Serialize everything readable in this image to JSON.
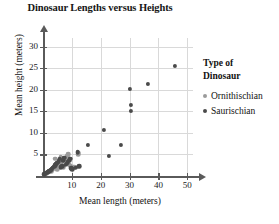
{
  "chart_data": {
    "type": "scatter",
    "title": "Dinosaur Lengths versus Heights",
    "xlabel": "Mean length (meters)",
    "ylabel": "Mean height (meters)",
    "xlim": [
      0,
      52
    ],
    "ylim": [
      0,
      32
    ],
    "xticks": [
      10,
      20,
      30,
      40,
      50
    ],
    "yticks": [
      5,
      10,
      15,
      20,
      25,
      30
    ],
    "grid": true,
    "legend_position": "right",
    "legend_title_line1": "Type of",
    "legend_title_line2": "Dinosaur",
    "series": [
      {
        "name": "Ornithischian",
        "color": "#9b9b9b",
        "points": [
          [
            0.8,
            0.5
          ],
          [
            1.2,
            0.7
          ],
          [
            1.6,
            0.9
          ],
          [
            2.0,
            1.0
          ],
          [
            2.4,
            1.2
          ],
          [
            2.8,
            1.4
          ],
          [
            3.2,
            1.5
          ],
          [
            3.6,
            1.8
          ],
          [
            4.0,
            2.0
          ],
          [
            4.4,
            2.1
          ],
          [
            4.8,
            2.3
          ],
          [
            5.2,
            2.5
          ],
          [
            5.6,
            2.7
          ],
          [
            6.0,
            3.0
          ],
          [
            6.4,
            3.2
          ],
          [
            6.8,
            3.4
          ],
          [
            7.2,
            3.6
          ],
          [
            7.6,
            3.9
          ],
          [
            8.0,
            4.1
          ],
          [
            8.4,
            4.6
          ],
          [
            8.8,
            5.0
          ],
          [
            9.0,
            2.6
          ],
          [
            9.4,
            2.4
          ],
          [
            9.8,
            2.2
          ],
          [
            10.4,
            2.1
          ],
          [
            11.0,
            2.0
          ],
          [
            12.0,
            2.1
          ],
          [
            12.2,
            5.1
          ],
          [
            12.4,
            5.4
          ],
          [
            7.0,
            2.0
          ],
          [
            5.0,
            1.6
          ],
          [
            3.0,
            1.0
          ],
          [
            4.2,
            4.0
          ],
          [
            6.2,
            4.4
          ],
          [
            8.2,
            3.0
          ]
        ]
      },
      {
        "name": "Saurischian",
        "color": "#4a4a4a",
        "points": [
          [
            0.5,
            0.4
          ],
          [
            1.0,
            0.6
          ],
          [
            1.4,
            0.8
          ],
          [
            1.8,
            1.0
          ],
          [
            2.2,
            1.1
          ],
          [
            2.6,
            1.3
          ],
          [
            3.0,
            1.6
          ],
          [
            3.4,
            1.9
          ],
          [
            3.8,
            2.2
          ],
          [
            4.2,
            2.5
          ],
          [
            4.6,
            2.8
          ],
          [
            5.0,
            3.1
          ],
          [
            5.4,
            3.4
          ],
          [
            5.8,
            4.0
          ],
          [
            6.2,
            2.0
          ],
          [
            6.6,
            2.3
          ],
          [
            7.0,
            3.7
          ],
          [
            7.4,
            4.2
          ],
          [
            7.8,
            2.6
          ],
          [
            8.2,
            2.8
          ],
          [
            8.6,
            3.2
          ],
          [
            9.0,
            3.5
          ],
          [
            9.4,
            4.0
          ],
          [
            9.8,
            1.8
          ],
          [
            10.2,
            1.6
          ],
          [
            11.4,
            1.9
          ],
          [
            12.0,
            5.5
          ],
          [
            12.6,
            2.3
          ],
          [
            15.5,
            7.2
          ],
          [
            21.0,
            10.6
          ],
          [
            23.0,
            4.6
          ],
          [
            27.0,
            7.3
          ],
          [
            30.2,
            20.2
          ],
          [
            30.6,
            16.4
          ],
          [
            30.6,
            15.1
          ],
          [
            36.5,
            21.4
          ],
          [
            45.8,
            25.6
          ]
        ]
      }
    ]
  }
}
